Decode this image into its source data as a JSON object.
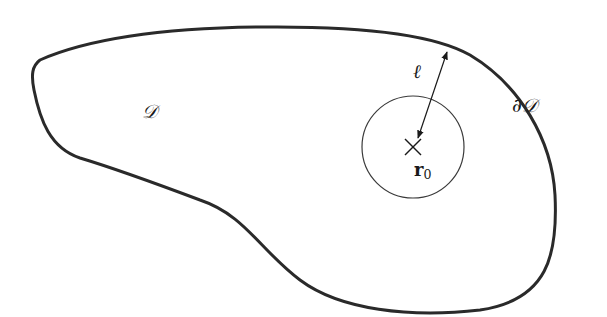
{
  "diagram": {
    "region_label": "𝒟",
    "boundary_label": "∂𝒟",
    "distance_label": "ℓ",
    "point_label_main": "r",
    "point_label_sub": "0",
    "colors": {
      "boundary": "#2a2a2a",
      "circle": "#3a3a3a",
      "text": "#1a1a1a",
      "background": "#ffffff"
    }
  }
}
